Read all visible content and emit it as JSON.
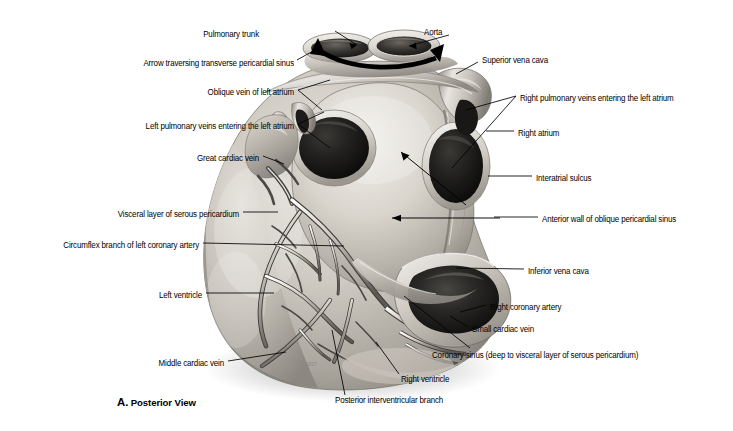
{
  "figure": {
    "caption_letter": "A.",
    "caption_text": "Posterior View",
    "view": "Posterior View"
  },
  "labels_left": [
    {
      "id": "arrow-transverse-pericardial-sinus",
      "text": "Arrow traversing transverse pericardial sinus",
      "x": 294,
      "y": 63
    },
    {
      "id": "oblique-vein-left-atrium",
      "text": "Oblique vein of left atrium",
      "x": 294,
      "y": 92
    },
    {
      "id": "left-pulmonary-veins",
      "text": "Left pulmonary veins entering the left atrium",
      "x": 294,
      "y": 126
    },
    {
      "id": "great-cardiac-vein",
      "text": "Great cardiac vein",
      "x": 259,
      "y": 158
    },
    {
      "id": "visceral-layer-serous-pericardium",
      "text": "Visceral layer of serous pericardium",
      "x": 239,
      "y": 214
    },
    {
      "id": "circumflex-branch-left-coronary-artery",
      "text": "Circumflex branch of left coronary artery",
      "x": 199,
      "y": 245
    },
    {
      "id": "left-ventricle",
      "text": "Left ventricle",
      "x": 202,
      "y": 295
    },
    {
      "id": "middle-cardiac-vein",
      "text": "Middle cardiac vein",
      "x": 224,
      "y": 363
    }
  ],
  "labels_right": [
    {
      "id": "superior-vena-cava",
      "text": "Superior vena cava",
      "x": 482,
      "y": 60
    },
    {
      "id": "right-pulmonary-veins",
      "text": "Right pulmonary veins entering the left atrium",
      "x": 520,
      "y": 98
    },
    {
      "id": "right-atrium",
      "text": "Right atrium",
      "x": 518,
      "y": 133
    },
    {
      "id": "interatrial-sulcus",
      "text": "Interatrial sulcus",
      "x": 536,
      "y": 178
    },
    {
      "id": "anterior-wall-oblique-pericardial-sinus",
      "text": "Anterior wall of oblique pericardial sinus",
      "x": 542,
      "y": 219
    },
    {
      "id": "inferior-vena-cava",
      "text": "Inferior vena cava",
      "x": 528,
      "y": 271
    },
    {
      "id": "right-coronary-artery",
      "text": "Right coronary artery",
      "x": 490,
      "y": 307
    },
    {
      "id": "small-cardiac-vein",
      "text": "Small cardiac vein",
      "x": 472,
      "y": 329
    },
    {
      "id": "coronary-sinus",
      "text": "Coronary sinus (deep to visceral layer of serous pericardium)",
      "x": 432,
      "y": 355
    }
  ],
  "labels_top": [
    {
      "id": "pulmonary-trunk",
      "text": "Pulmonary trunk",
      "x": 259,
      "y": 34
    },
    {
      "id": "aorta",
      "text": "Aorta",
      "x": 424,
      "y": 32
    }
  ],
  "labels_bottom": [
    {
      "id": "right-ventricle",
      "text": "Right ventricle",
      "x": 401,
      "y": 379
    },
    {
      "id": "posterior-interventricular-branch",
      "text": "Posterior interventricular branch",
      "x": 335,
      "y": 400
    }
  ],
  "colors": {
    "background": "#ffffff",
    "text": "#000000",
    "leader_line": "#000000",
    "tissue_light": "#dddad4",
    "tissue_mid": "#b3aea6",
    "tissue_dark": "#7e7a73",
    "cavity_dark": "#141414",
    "vessel_shadow": "#4a4843"
  }
}
